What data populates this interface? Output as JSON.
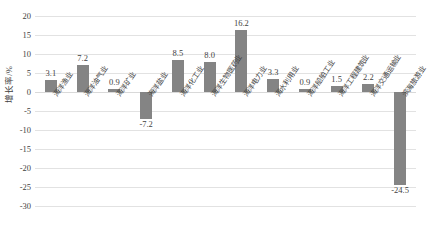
{
  "chart_data": {
    "type": "bar",
    "title": "",
    "subtitle": "",
    "xlabel": "",
    "ylabel": "增长率/%",
    "ylim": [
      -30,
      20
    ],
    "yticks": [
      20,
      15,
      10,
      5,
      0,
      -5,
      -10,
      -15,
      -20,
      -25,
      -30
    ],
    "grid": true,
    "legend": false,
    "legend_position": "none",
    "bar_color": "#848484",
    "categories": [
      "海洋渔业",
      "海洋油气业",
      "海洋矿业",
      "海洋盐业",
      "海洋化工业",
      "海洋生物医药业",
      "海洋电力业",
      "海水利用业",
      "海洋船舶工业",
      "海洋工程建筑业",
      "海洋交通运输业",
      "滨海旅游业"
    ],
    "values": [
      3.1,
      7.2,
      0.9,
      -7.2,
      8.5,
      8.0,
      16.2,
      3.3,
      0.9,
      1.5,
      2.2,
      -24.5
    ],
    "data_labels": [
      "3.1",
      "7.2",
      "0.9",
      "-7.2",
      "8.5",
      "8.0",
      "16.2",
      "3.3",
      "0.9",
      "1.5",
      "2.2",
      "-24.5"
    ]
  }
}
